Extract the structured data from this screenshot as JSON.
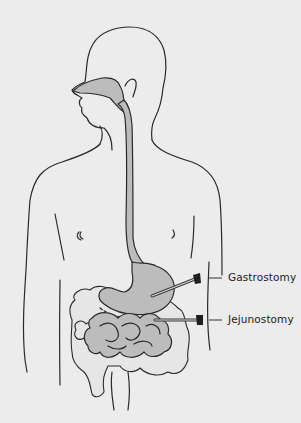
{
  "diagram": {
    "background_color": "#ececec",
    "organ_fill_color": "#bcbcbc",
    "labels": [
      {
        "id": "gastrostomy",
        "text": "Gastrostomy"
      },
      {
        "id": "jejunostomy",
        "text": "Jejunostomy"
      }
    ],
    "structures": [
      "head-profile",
      "nasal-cavity",
      "esophagus",
      "stomach",
      "colon",
      "small-intestine",
      "gastrostomy-tube",
      "jejunostomy-tube"
    ]
  }
}
